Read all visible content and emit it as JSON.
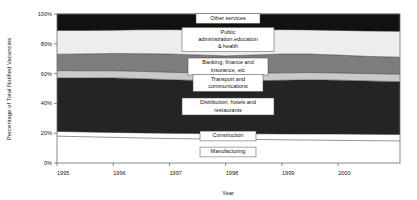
{
  "chart_data": {
    "type": "area",
    "title": "",
    "xlabel": "Year",
    "ylabel": "Percentage of Total Notified Vacancies",
    "stacked": true,
    "normalized_percent": true,
    "grid": false,
    "legend_position": "inline-callouts",
    "ylim": [
      0,
      100
    ],
    "ytick_labels": [
      "0%",
      "20%",
      "40%",
      "60%",
      "80%",
      "100%"
    ],
    "ytick_values": [
      0,
      20,
      40,
      60,
      80,
      100
    ],
    "xtick_labels": [
      "1995",
      "1996",
      "1997",
      "1998",
      "1999",
      "2000"
    ],
    "xtick_values": [
      1995,
      1996,
      1997,
      1998,
      1999,
      2000
    ],
    "xlim": [
      1995,
      2001.1
    ],
    "x": [
      1995,
      1995.5,
      1996,
      1996.5,
      1997,
      1997.5,
      1998,
      1998.5,
      1999,
      1999.5,
      2000,
      2000.5,
      2001.1
    ],
    "series": [
      {
        "name": "Manufacturing",
        "color": "#ffffff",
        "values": [
          18.0,
          17.6,
          17.2,
          16.8,
          16.4,
          16.2,
          16.0,
          15.8,
          15.6,
          15.4,
          15.2,
          15.0,
          14.8
        ]
      },
      {
        "name": "Construction",
        "color": "#ffffff",
        "values": [
          3.2,
          3.2,
          3.3,
          3.4,
          3.5,
          3.6,
          3.7,
          3.8,
          3.9,
          4.0,
          4.2,
          4.3,
          4.4
        ]
      },
      {
        "name": "Distribution, hotels and restaurants",
        "color": "#242424",
        "values": [
          35.8,
          36.2,
          36.6,
          36.4,
          36.0,
          35.6,
          35.2,
          35.6,
          36.0,
          36.4,
          36.2,
          35.8,
          35.4
        ]
      },
      {
        "name": "Transport and communications",
        "color": "#c9c9c9",
        "values": [
          5.0,
          4.9,
          4.8,
          4.9,
          5.0,
          5.1,
          5.2,
          5.1,
          5.0,
          4.9,
          4.8,
          4.9,
          5.0
        ]
      },
      {
        "name": "Banking, finance and insurance, etc",
        "color": "#7d7d7d",
        "values": [
          11.0,
          11.3,
          11.6,
          11.9,
          12.2,
          12.0,
          11.8,
          12.2,
          12.6,
          12.4,
          12.0,
          11.6,
          11.4
        ]
      },
      {
        "name": "Public administration,education & health",
        "color": "#ededed",
        "values": [
          16.0,
          15.8,
          15.6,
          16.0,
          16.4,
          16.8,
          17.2,
          16.8,
          16.4,
          16.2,
          16.6,
          17.0,
          17.4
        ]
      },
      {
        "name": "Other services",
        "color": "#111111",
        "values": [
          11.0,
          11.0,
          10.9,
          10.6,
          10.5,
          10.7,
          10.9,
          10.7,
          10.5,
          10.7,
          11.0,
          11.4,
          11.6
        ]
      }
    ],
    "callouts": [
      {
        "label": "Other services",
        "lines": [
          "Other services"
        ]
      },
      {
        "label": "Public administration,education & health",
        "lines": [
          "Public",
          "administration,education",
          "& health"
        ]
      },
      {
        "label": "Banking, finance and insurance, etc",
        "lines": [
          "Banking, finance and",
          "insurance, etc"
        ]
      },
      {
        "label": "Transport and communications",
        "lines": [
          "Transport and",
          "communications"
        ]
      },
      {
        "label": "Distribution, hotels and restaurants",
        "lines": [
          "Distribution, hotels and",
          "restaurants"
        ]
      },
      {
        "label": "Construction",
        "lines": [
          "Construction"
        ]
      },
      {
        "label": "Manufacturing",
        "lines": [
          "Manufacturing"
        ]
      }
    ]
  }
}
